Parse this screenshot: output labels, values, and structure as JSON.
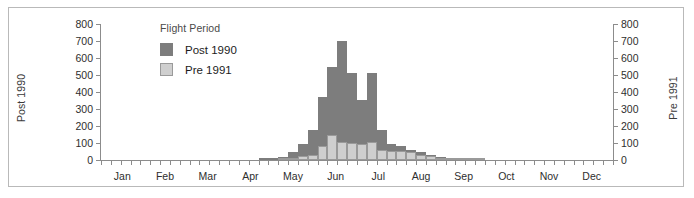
{
  "chart_data": {
    "type": "bar",
    "title": "",
    "subtitle": "",
    "stacked": true,
    "xlabel": "",
    "ylabel": "Post 1990",
    "ylabel_right": "Pre 1991",
    "ylim": [
      0,
      800
    ],
    "yticks": [
      0,
      100,
      200,
      300,
      400,
      500,
      600,
      700,
      800
    ],
    "ytick_labels": [
      "0",
      "100",
      "200",
      "300",
      "400",
      "500",
      "600",
      "700",
      "800"
    ],
    "grid": false,
    "legend": {
      "title": "Flight Period",
      "position": "inside-upper-left",
      "entries": [
        {
          "name": "Post 1990",
          "color": "#7d7d7d"
        },
        {
          "name": "Pre 1991",
          "color": "#cfcfcf"
        }
      ]
    },
    "month_labels": [
      "Jan",
      "Feb",
      "Mar",
      "Apr",
      "May",
      "Jun",
      "Jul",
      "Aug",
      "Sep",
      "Oct",
      "Nov",
      "Dec"
    ],
    "x_units": "week",
    "x_bins": 52,
    "series": [
      {
        "name": "Post 1990",
        "color": "#7d7d7d",
        "values": [
          0,
          0,
          0,
          0,
          0,
          0,
          0,
          0,
          0,
          0,
          0,
          0,
          0,
          0,
          0,
          0,
          5,
          10,
          20,
          50,
          95,
          175,
          370,
          545,
          700,
          510,
          355,
          510,
          175,
          95,
          85,
          60,
          45,
          30,
          20,
          12,
          8,
          5,
          3,
          0,
          0,
          0,
          0,
          0,
          0,
          0,
          0,
          0,
          0,
          0,
          0,
          0
        ]
      },
      {
        "name": "Pre 1991",
        "color": "#cfcfcf",
        "values": [
          0,
          0,
          0,
          0,
          0,
          0,
          0,
          0,
          0,
          0,
          0,
          0,
          0,
          0,
          0,
          0,
          0,
          0,
          5,
          10,
          25,
          30,
          85,
          150,
          105,
          100,
          95,
          105,
          60,
          55,
          55,
          45,
          30,
          22,
          12,
          8,
          5,
          3,
          2,
          0,
          0,
          0,
          0,
          0,
          0,
          0,
          0,
          0,
          0,
          0,
          0,
          0
        ]
      }
    ]
  },
  "axes": {
    "left_title": "Post 1990",
    "right_title": "Pre 1991"
  }
}
